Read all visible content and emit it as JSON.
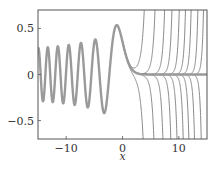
{
  "chart_data": {
    "type": "line",
    "title": "",
    "xlabel": "x",
    "ylabel": "",
    "xlim": [
      -15,
      15
    ],
    "ylim": [
      -0.7,
      0.7
    ],
    "grid": false,
    "legend": null,
    "xticks": [
      -10,
      0,
      10
    ],
    "xtick_labels": [
      "−10",
      "0",
      "10"
    ],
    "yticks": [
      -0.5,
      0,
      0.5
    ],
    "ytick_labels": [
      "−0.5",
      "0",
      "0.5"
    ],
    "series": [
      {
        "name": "Ai(x)",
        "style": "thick grey",
        "color": "#9a9a9a",
        "description": "Airy function Ai(x): oscillates for x<0 (max ≈0.536 at x≈−1.02, min ≈−0.419 at x≈−3.25) and decays to 0 for x>0",
        "sample_points": [
          {
            "x": -15,
            "y": 0.2
          },
          {
            "x": -4.82,
            "y": 0.38
          },
          {
            "x": -3.25,
            "y": -0.419
          },
          {
            "x": -1.02,
            "y": 0.536
          },
          {
            "x": 0,
            "y": 0.355
          },
          {
            "x": 2,
            "y": 0.035
          },
          {
            "x": 5,
            "y": 0.0001
          }
        ]
      },
      {
        "name": "perturbed solutions diverging upward",
        "style": "thin grey",
        "color": "#6e6e6e",
        "top_exit_x": [
          3.9,
          5.8,
          7.5,
          8.8,
          10.1,
          11.2,
          12.2,
          13.4,
          14.4
        ]
      },
      {
        "name": "perturbed solutions diverging downward",
        "style": "thin grey",
        "color": "#6e6e6e",
        "bottom_exit_x": [
          3.7,
          5.6,
          7.2,
          8.6,
          9.7,
          10.8,
          11.8,
          12.8,
          14.0
        ]
      }
    ]
  },
  "colors": {
    "axes": "#555555",
    "main_curve": "#9a9a9a",
    "thin_curves": "#7a7a7a",
    "text": "#333333"
  }
}
